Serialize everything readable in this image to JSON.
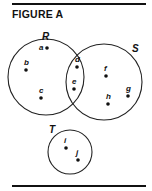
{
  "figure": {
    "title": "FIGURE A",
    "sets": [
      {
        "name": "R",
        "cx": 46,
        "cy": 77,
        "r": 38,
        "label_x": 42,
        "label_y": 40
      },
      {
        "name": "S",
        "cx": 104,
        "cy": 82,
        "r": 38,
        "label_x": 132,
        "label_y": 52
      },
      {
        "name": "T",
        "cx": 70,
        "cy": 152,
        "r": 22,
        "label_x": 49,
        "label_y": 133
      }
    ],
    "points": [
      {
        "name": "a",
        "x": 47,
        "y": 48,
        "set": "R only"
      },
      {
        "name": "b",
        "x": 26,
        "y": 70,
        "set": "R only"
      },
      {
        "name": "c",
        "x": 41,
        "y": 98,
        "set": "R only"
      },
      {
        "name": "d",
        "x": 77,
        "y": 67,
        "set": "R and S"
      },
      {
        "name": "e",
        "x": 74,
        "y": 89,
        "set": "R and S"
      },
      {
        "name": "f",
        "x": 106,
        "y": 76,
        "set": "S only"
      },
      {
        "name": "g",
        "x": 128,
        "y": 96,
        "set": "S only"
      },
      {
        "name": "h",
        "x": 108,
        "y": 104,
        "set": "S only"
      },
      {
        "name": "i",
        "x": 66,
        "y": 148,
        "set": "T only"
      },
      {
        "name": "j",
        "x": 78,
        "y": 160,
        "set": "T only"
      }
    ]
  }
}
